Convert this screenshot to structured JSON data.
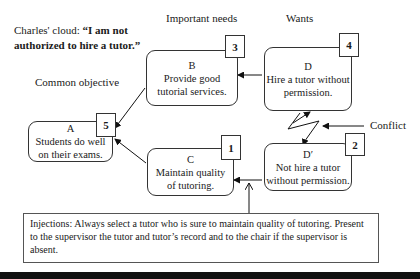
{
  "title": {
    "prefix": "Charles' cloud: ",
    "quote_line1": "“I am not",
    "quote_line2": "authorized to hire a tutor.”"
  },
  "column_labels": {
    "common_objective": "Common objective",
    "important_needs": "Important needs",
    "wants": "Wants"
  },
  "nodes": {
    "A": {
      "letter": "A",
      "line1": "Students do well",
      "line2": "on their exams.",
      "number": "5"
    },
    "B": {
      "letter": "B",
      "line1": "Provide good",
      "line2": "tutorial services.",
      "number": "3"
    },
    "C": {
      "letter": "C",
      "line1": "Maintain quality",
      "line2": "of tutoring.",
      "number": "1"
    },
    "D": {
      "letter": "D",
      "line1": "Hire a tutor without",
      "line2": "permission.",
      "number": "4"
    },
    "Dprime": {
      "letter": "D′",
      "line1": "Not hire a tutor",
      "line2": "without permission.",
      "number": "2"
    }
  },
  "conflict_label": "Conflict",
  "injections": {
    "text": "Injections: Always select a tutor who is sure to maintain quality of tutoring. Present to the supervisor the tutor and tutor’s record and to the chair if the supervisor is absent."
  }
}
